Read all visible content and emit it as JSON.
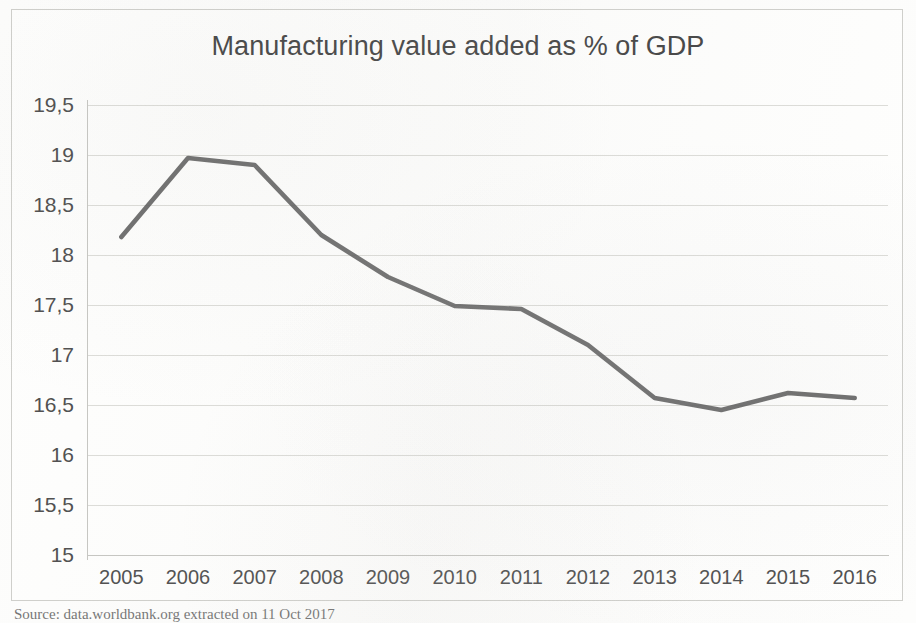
{
  "source_note": "Source: data.worldbank.org extracted on 11 Oct 2017",
  "chart_data": {
    "type": "line",
    "title": "Manufacturing value added as % of GDP",
    "xlabel": "",
    "ylabel": "",
    "categories": [
      "2005",
      "2006",
      "2007",
      "2008",
      "2009",
      "2010",
      "2011",
      "2012",
      "2013",
      "2014",
      "2015",
      "2016"
    ],
    "values": [
      18.18,
      18.97,
      18.9,
      18.2,
      17.78,
      17.49,
      17.46,
      17.1,
      16.57,
      16.45,
      16.62,
      16.57
    ],
    "series": [
      {
        "name": "Manufacturing value added as % of GDP",
        "values": [
          18.18,
          18.97,
          18.9,
          18.2,
          17.78,
          17.49,
          17.46,
          17.1,
          16.57,
          16.45,
          16.62,
          16.57
        ]
      }
    ],
    "ylim": [
      15,
      19.5
    ],
    "ytick_labels": [
      "19,5",
      "19",
      "18,5",
      "18",
      "17,5",
      "17",
      "16,5",
      "16",
      "15,5",
      "15"
    ],
    "ytick_values": [
      19.5,
      19,
      18.5,
      18,
      17.5,
      17,
      16.5,
      16,
      15.5,
      15
    ],
    "grid": true,
    "legend": false,
    "line_color": "#595959",
    "grid_color": "#dcdcd8",
    "text_color": "#4f4f4f",
    "title_color": "#434343"
  }
}
